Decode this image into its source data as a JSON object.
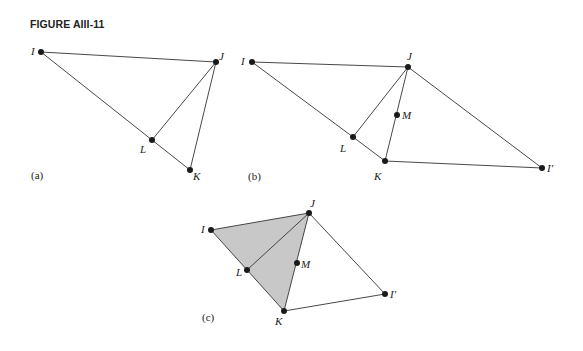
{
  "figure": {
    "title": "FIGURE AIII-11",
    "panels": [
      {
        "id": "a",
        "label": "(a)",
        "points": {
          "I": [
            41,
            52
          ],
          "J": [
            216,
            62
          ],
          "L": [
            152,
            140
          ],
          "K": [
            190,
            170
          ]
        },
        "edges": [
          [
            "I",
            "J"
          ],
          [
            "I",
            "L"
          ],
          [
            "L",
            "K"
          ],
          [
            "J",
            "L"
          ],
          [
            "J",
            "K"
          ]
        ],
        "labels": {
          "I": "I",
          "J": "J",
          "L": "L",
          "K": "K"
        }
      },
      {
        "id": "b",
        "label": "(b)",
        "points": {
          "I": [
            252,
            62
          ],
          "J": [
            408,
            67
          ],
          "M": [
            397,
            115
          ],
          "L": [
            353,
            137
          ],
          "K": [
            385,
            161
          ],
          "I2": [
            542,
            168
          ]
        },
        "edges": [
          [
            "I",
            "J"
          ],
          [
            "I",
            "L"
          ],
          [
            "L",
            "K"
          ],
          [
            "J",
            "L"
          ],
          [
            "J",
            "K"
          ],
          [
            "J",
            "I2"
          ],
          [
            "K",
            "I2"
          ]
        ],
        "labels": {
          "I": "I",
          "J": "J",
          "M": "M",
          "L": "L",
          "K": "K",
          "I2": "I′"
        }
      },
      {
        "id": "c",
        "label": "(c)",
        "points": {
          "I": [
            211,
            230
          ],
          "J": [
            309,
            213
          ],
          "M": [
            297,
            263
          ],
          "L": [
            247,
            270
          ],
          "K": [
            284,
            311
          ],
          "I2": [
            385,
            294
          ]
        },
        "shaded": [
          "I",
          "J",
          "K"
        ],
        "edges": [
          [
            "I",
            "J"
          ],
          [
            "I",
            "L"
          ],
          [
            "L",
            "K"
          ],
          [
            "J",
            "L"
          ],
          [
            "J",
            "K"
          ],
          [
            "J",
            "I2"
          ],
          [
            "K",
            "I2"
          ]
        ],
        "labels": {
          "I": "I",
          "J": "J",
          "M": "M",
          "L": "L",
          "K": "K",
          "I2": "I′"
        }
      }
    ]
  }
}
